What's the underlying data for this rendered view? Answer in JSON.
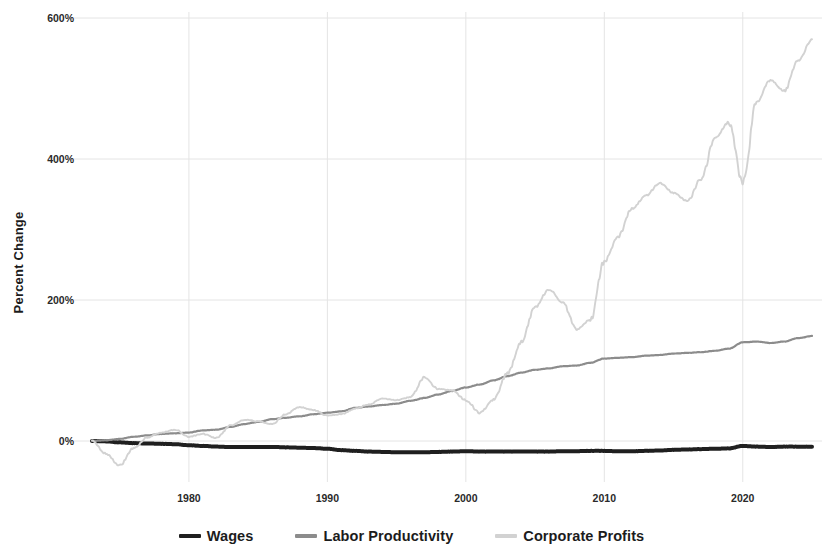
{
  "chart_data": {
    "type": "line",
    "title": "",
    "xlabel": "",
    "ylabel": "Percent Change",
    "xlim": [
      1973,
      2025
    ],
    "ylim": [
      -60,
      620
    ],
    "grid": true,
    "legend_position": "bottom",
    "y_ticks": [
      "0%",
      "200%",
      "400%",
      "600%"
    ],
    "y_tick_values": [
      0,
      200,
      400,
      600
    ],
    "x_ticks": [
      "1980",
      "1990",
      "2000",
      "2010",
      "2020"
    ],
    "x_tick_values": [
      1980,
      1990,
      2000,
      2010,
      2020
    ],
    "colors": {
      "wages": "#1f1f1f",
      "labor_productivity": "#8c8c8c",
      "corporate_profits": "#d2d2d2",
      "gridline": "#e4e4e4",
      "background": "#ffffff"
    },
    "series": [
      {
        "name": "Wages",
        "color": "#1f1f1f",
        "x": [
          1973,
          1974,
          1975,
          1976,
          1977,
          1978,
          1979,
          1980,
          1981,
          1982,
          1983,
          1984,
          1985,
          1986,
          1987,
          1988,
          1989,
          1990,
          1991,
          1992,
          1993,
          1994,
          1995,
          1996,
          1997,
          1998,
          1999,
          2000,
          2001,
          2002,
          2003,
          2004,
          2005,
          2006,
          2007,
          2008,
          2009,
          2010,
          2011,
          2012,
          2013,
          2014,
          2015,
          2016,
          2017,
          2018,
          2019,
          2020,
          2021,
          2022,
          2023,
          2024,
          2025
        ],
        "values": [
          0,
          -0.5,
          -2,
          -3,
          -3.5,
          -4,
          -4.5,
          -6,
          -7,
          -8,
          -8.5,
          -8.5,
          -8.5,
          -8.5,
          -9,
          -9.5,
          -10,
          -11,
          -13,
          -14,
          -15,
          -15.5,
          -16,
          -16,
          -16,
          -15.5,
          -15,
          -14.5,
          -15,
          -15,
          -15,
          -15,
          -15,
          -15,
          -14.5,
          -14.5,
          -14,
          -14,
          -14.5,
          -14.5,
          -14,
          -13.5,
          -12.5,
          -12,
          -11.5,
          -11,
          -10.5,
          -7,
          -8,
          -8.5,
          -8,
          -8,
          -8
        ]
      },
      {
        "name": "Labor Productivity",
        "color": "#8c8c8c",
        "x": [
          1973,
          1974,
          1975,
          1976,
          1977,
          1978,
          1979,
          1980,
          1981,
          1982,
          1983,
          1984,
          1985,
          1986,
          1987,
          1988,
          1989,
          1990,
          1991,
          1992,
          1993,
          1994,
          1995,
          1996,
          1997,
          1998,
          1999,
          2000,
          2001,
          2002,
          2003,
          2004,
          2005,
          2006,
          2007,
          2008,
          2009,
          2010,
          2011,
          2012,
          2013,
          2014,
          2015,
          2016,
          2017,
          2018,
          2019,
          2020,
          2021,
          2022,
          2023,
          2024,
          2025
        ],
        "values": [
          0,
          1,
          3,
          6,
          8,
          10,
          11,
          12,
          15,
          16,
          20,
          24,
          27,
          31,
          33,
          35,
          38,
          40,
          42,
          47,
          49,
          51,
          53,
          57,
          61,
          66,
          71,
          76,
          80,
          86,
          92,
          97,
          101,
          103,
          106,
          107,
          111,
          117,
          118,
          119,
          121,
          122,
          124,
          125,
          126,
          128,
          131,
          140,
          141,
          139,
          141,
          146,
          149
        ]
      },
      {
        "name": "Corporate Profits",
        "color": "#d2d2d2",
        "x": [
          1973,
          1974,
          1975,
          1976,
          1977,
          1978,
          1979,
          1980,
          1981,
          1982,
          1983,
          1984,
          1985,
          1986,
          1987,
          1988,
          1989,
          1990,
          1991,
          1992,
          1993,
          1994,
          1995,
          1996,
          1997,
          1998,
          1999,
          2000,
          2001,
          2002,
          2003,
          2004,
          2005,
          2006,
          2007,
          2008,
          2009,
          2010,
          2011,
          2012,
          2013,
          2014,
          2015,
          2016,
          2017,
          2018,
          2019,
          2020,
          2021,
          2022,
          2023,
          2024,
          2025
        ],
        "values": [
          0,
          -18,
          -35,
          -10,
          5,
          12,
          16,
          6,
          10,
          4,
          22,
          30,
          28,
          24,
          38,
          48,
          44,
          36,
          38,
          46,
          52,
          60,
          58,
          62,
          90,
          74,
          72,
          58,
          40,
          58,
          96,
          140,
          190,
          215,
          196,
          158,
          172,
          255,
          290,
          330,
          348,
          366,
          352,
          340,
          372,
          430,
          452,
          366,
          480,
          512,
          496,
          540,
          570
        ]
      }
    ],
    "annotations": {
      "wages_note": "Wages remain near or slightly below 0% across the entire period",
      "productivity_note": "Labor Productivity rises steadily to about 149%",
      "profits_note": "Corporate Profits rise sharply with volatility to about 570%"
    }
  },
  "legend": {
    "items": [
      {
        "label": "Wages",
        "color": "#1f1f1f"
      },
      {
        "label": "Labor Productivity",
        "color": "#8c8c8c"
      },
      {
        "label": "Corporate Profits",
        "color": "#d2d2d2"
      }
    ]
  },
  "axes": {
    "y_title": "Percent Change"
  }
}
